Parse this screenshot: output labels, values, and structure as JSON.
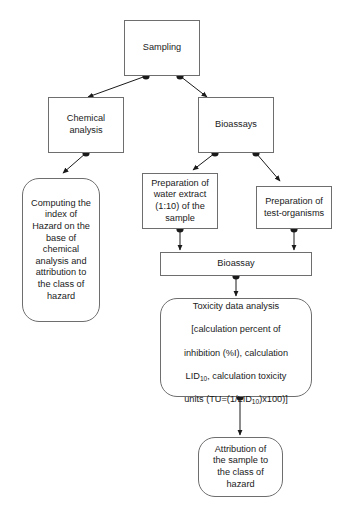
{
  "diagram": {
    "background": "#ffffff",
    "line_color": "#1a1a1a",
    "box_border_color": "#6e6e6e",
    "text_color": "#1a1a1a",
    "nodes": {
      "sampling": {
        "label": "Sampling",
        "shape": "rectangle"
      },
      "chemical_analysis": {
        "label": "Chemical\nanalysis",
        "shape": "rectangle"
      },
      "bioassays": {
        "label": "Bioassays",
        "shape": "rectangle"
      },
      "computing_index": {
        "label": "Computing the\nindex of\nHazard on the\nbase of\nchemical\nanalysis and\nattribution to\nthe class of\nhazard",
        "shape": "rounded"
      },
      "water_extract": {
        "label": "Preparation of\nwater extract\n(1:10) of the\nsample",
        "shape": "rectangle"
      },
      "test_organisms": {
        "label": "Preparation of\ntest-organisms",
        "shape": "rectangle"
      },
      "bioassay": {
        "label": "Bioassay",
        "shape": "rectangle"
      },
      "toxicity_analysis": {
        "line1": "Toxicity data analysis",
        "line2": "[calculation percent of",
        "line3": "inhibition (%I), calculation",
        "line4_pre": "LID",
        "line4_sub": "10",
        "line4_post": ", calculation toxicity",
        "line5_pre": "units (TU=(1/LID",
        "line5_sub": "10",
        "line5_post": ")x100)]",
        "shape": "rounded"
      },
      "attribution": {
        "label": "Attribution of\nthe sample to\nthe class of\nhazard",
        "shape": "rounded"
      }
    },
    "edges": [
      {
        "name": "sampling-to-chemical-analysis",
        "from": "sampling",
        "to": "chemical_analysis"
      },
      {
        "name": "sampling-to-bioassays",
        "from": "sampling",
        "to": "bioassays"
      },
      {
        "name": "chemical-analysis-to-computing-index",
        "from": "chemical_analysis",
        "to": "computing_index"
      },
      {
        "name": "bioassays-to-water-extract",
        "from": "bioassays",
        "to": "water_extract"
      },
      {
        "name": "bioassays-to-test-organisms",
        "from": "bioassays",
        "to": "test_organisms"
      },
      {
        "name": "water-extract-to-bioassay",
        "from": "water_extract",
        "to": "bioassay"
      },
      {
        "name": "test-organisms-to-bioassay",
        "from": "test_organisms",
        "to": "bioassay"
      },
      {
        "name": "bioassay-to-toxicity-analysis",
        "from": "bioassay",
        "to": "toxicity_analysis"
      },
      {
        "name": "toxicity-analysis-to-attribution",
        "from": "toxicity_analysis",
        "to": "attribution"
      }
    ]
  }
}
